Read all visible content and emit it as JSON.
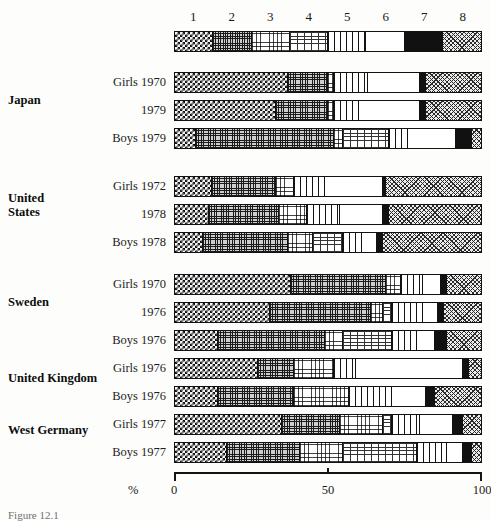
{
  "figure": {
    "caption": "Figure 12.1",
    "axis": {
      "unit_label": "%",
      "ticks": [
        {
          "value": 0,
          "label": "0"
        },
        {
          "value": 50,
          "label": "50"
        },
        {
          "value": 100,
          "label": "100"
        }
      ],
      "range": [
        0,
        100
      ]
    },
    "legend": {
      "numbers": [
        "1",
        "2",
        "3",
        "4",
        "5",
        "6",
        "7",
        "8"
      ],
      "patterns": [
        {
          "id": 1,
          "name": "checkerboard",
          "color": "#111111"
        },
        {
          "id": 2,
          "name": "fine-grid-mesh",
          "color": "#cfcfcf"
        },
        {
          "id": 3,
          "name": "sparse-dots",
          "color": "#ffffff"
        },
        {
          "id": 4,
          "name": "horizontal-dashes",
          "color": "#ffffff"
        },
        {
          "id": 5,
          "name": "vertical-stripes",
          "color": "#ffffff"
        },
        {
          "id": 6,
          "name": "blank-white",
          "color": "#ffffff"
        },
        {
          "id": 7,
          "name": "solid-black",
          "color": "#111111"
        },
        {
          "id": 8,
          "name": "diagonal-crosshatch",
          "color": "#ececec"
        }
      ],
      "key_values": [
        12.5,
        12.5,
        12.5,
        12.5,
        12.5,
        12.5,
        12.5,
        12.5
      ]
    }
  },
  "chart_data": {
    "type": "bar",
    "title": "",
    "subtitle": "",
    "xlabel": "%",
    "ylabel": "",
    "xlim": [
      0,
      100
    ],
    "grid": false,
    "legend_position": "top",
    "orientation": "horizontal-stacked",
    "categories": [
      "1",
      "2",
      "3",
      "4",
      "5",
      "6",
      "7",
      "8"
    ],
    "series": [
      {
        "name": "Legend key",
        "group": "",
        "row_label": "",
        "values": [
          12.5,
          12.5,
          12.5,
          12.5,
          12.5,
          12.5,
          12.5,
          12.5
        ]
      },
      {
        "name": "Japan Girls 1970",
        "group": "Japan",
        "row_label": "Girls 1970",
        "values": [
          37,
          13,
          2,
          0,
          11,
          17,
          2,
          18
        ]
      },
      {
        "name": "Japan 1979",
        "group": "Japan",
        "row_label": "1979",
        "values": [
          33,
          17,
          2,
          0,
          8,
          20,
          2,
          18
        ]
      },
      {
        "name": "Japan Boys 1979",
        "group": "Japan",
        "row_label": "Boys 1979",
        "values": [
          7,
          45,
          3,
          15,
          6,
          16,
          5,
          3
        ]
      },
      {
        "name": "United States Girls 1972",
        "group": "United States",
        "row_label": "Girls 1972",
        "values": [
          12,
          21,
          6,
          0,
          10,
          19,
          1,
          31
        ]
      },
      {
        "name": "United States 1978",
        "group": "United States",
        "row_label": "1978",
        "values": [
          11,
          23,
          9,
          0,
          11,
          14,
          2,
          30
        ]
      },
      {
        "name": "United States Boys 1978",
        "group": "United States",
        "row_label": "Boys 1978",
        "values": [
          9,
          28,
          8,
          10,
          6,
          5,
          2,
          32
        ]
      },
      {
        "name": "Sweden Girls 1970",
        "group": "Sweden",
        "row_label": "Girls 1970",
        "values": [
          38,
          31,
          5,
          0,
          7,
          6,
          2,
          11
        ]
      },
      {
        "name": "Sweden 1976",
        "group": "Sweden",
        "row_label": "1976",
        "values": [
          31,
          33,
          4,
          3,
          10,
          5,
          2,
          12
        ]
      },
      {
        "name": "Sweden Boys 1976",
        "group": "Sweden",
        "row_label": "Boys 1976",
        "values": [
          14,
          35,
          6,
          16,
          8,
          6,
          4,
          11
        ]
      },
      {
        "name": "United Kingdom Girls 1976",
        "group": "United Kingdom",
        "row_label": "Girls 1976",
        "values": [
          27,
          12,
          13,
          0,
          7,
          35,
          2,
          4
        ]
      },
      {
        "name": "United Kingdom Boys 1976",
        "group": "United Kingdom",
        "row_label": "Boys 1976",
        "values": [
          14,
          25,
          18,
          0,
          14,
          11,
          3,
          15
        ]
      },
      {
        "name": "West Germany Girls 1977",
        "group": "West Germany",
        "row_label": "Girls 1977",
        "values": [
          35,
          19,
          14,
          3,
          9,
          11,
          3,
          6
        ]
      },
      {
        "name": "West Germany Boys 1977",
        "group": "West Germany",
        "row_label": "Boys 1977",
        "values": [
          17,
          24,
          14,
          24,
          10,
          5,
          3,
          3
        ]
      }
    ]
  },
  "groups": [
    {
      "label": "Japan",
      "rows": [
        "Girls 1970",
        "1979",
        "Boys 1979"
      ]
    },
    {
      "label": "United States",
      "label_line1": "United",
      "label_line2": "States",
      "rows": [
        "Girls 1972",
        "1978",
        "Boys 1978"
      ]
    },
    {
      "label": "Sweden",
      "rows": [
        "Girls 1970",
        "1976",
        "Boys 1976"
      ]
    },
    {
      "label": "United Kingdom",
      "rows": [
        "Girls 1976",
        "Boys 1976"
      ]
    },
    {
      "label": "West Germany",
      "rows": [
        "Girls 1977",
        "Boys 1977"
      ]
    }
  ]
}
